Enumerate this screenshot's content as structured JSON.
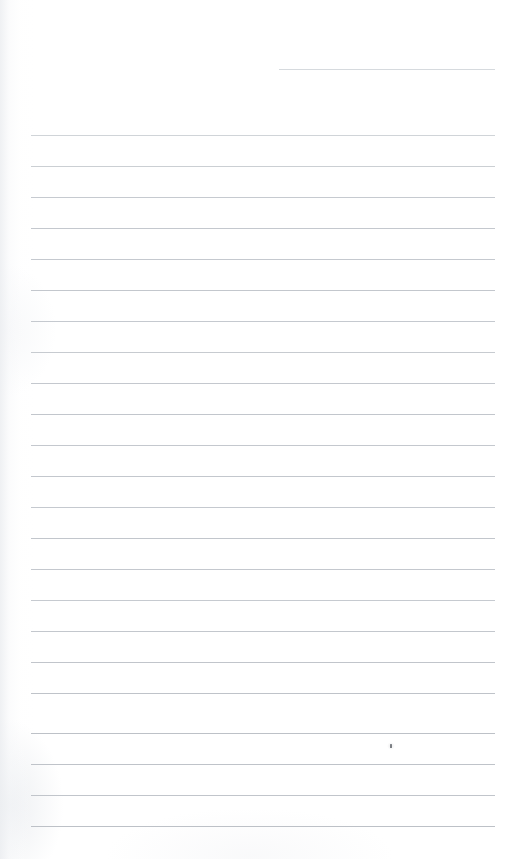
{
  "document": {
    "kind": "scanned-page",
    "title": "Blank ruled notepad page",
    "page_width": 512,
    "page_height": 859,
    "background_color": "#ffffff",
    "content_text": "",
    "has_handwriting": false,
    "notes": "Empty lined paper scan; no text, no headings, no page number."
  },
  "ruling": {
    "line_color": "#c8ccd1",
    "line_color_faint": "#d9dde1",
    "line_color_strong": "#b9bec4",
    "line_thickness_px": 1,
    "left_margin_x": 31,
    "right_margin_x": 495,
    "line_spacing_px": 31,
    "total_lines": 24,
    "partial_first_line": true,
    "lines": [
      {
        "y": 69,
        "x1": 279,
        "x2": 495,
        "color": "#cfd3d8",
        "opacity": 0.85
      },
      {
        "y": 135,
        "x1": 31,
        "x2": 495,
        "color": "#cbcfd4",
        "opacity": 0.9
      },
      {
        "y": 166,
        "x1": 31,
        "x2": 495,
        "color": "#c8ccd1",
        "opacity": 0.95
      },
      {
        "y": 197,
        "x1": 31,
        "x2": 495,
        "color": "#c6cad0",
        "opacity": 1
      },
      {
        "y": 228,
        "x1": 31,
        "x2": 495,
        "color": "#c4c8ce",
        "opacity": 1
      },
      {
        "y": 259,
        "x1": 31,
        "x2": 495,
        "color": "#c5c9cf",
        "opacity": 1
      },
      {
        "y": 290,
        "x1": 31,
        "x2": 495,
        "color": "#c3c7cd",
        "opacity": 1
      },
      {
        "y": 321,
        "x1": 31,
        "x2": 495,
        "color": "#c5c9cf",
        "opacity": 1
      },
      {
        "y": 352,
        "x1": 31,
        "x2": 495,
        "color": "#c7cbd0",
        "opacity": 1
      },
      {
        "y": 383,
        "x1": 31,
        "x2": 495,
        "color": "#c4c8ce",
        "opacity": 1
      },
      {
        "y": 414,
        "x1": 31,
        "x2": 495,
        "color": "#c2c6cc",
        "opacity": 1
      },
      {
        "y": 445,
        "x1": 31,
        "x2": 495,
        "color": "#c4c8ce",
        "opacity": 1
      },
      {
        "y": 476,
        "x1": 31,
        "x2": 495,
        "color": "#c3c7cd",
        "opacity": 1
      },
      {
        "y": 507,
        "x1": 31,
        "x2": 495,
        "color": "#c5c9cf",
        "opacity": 1
      },
      {
        "y": 538,
        "x1": 31,
        "x2": 495,
        "color": "#c2c6cc",
        "opacity": 1
      },
      {
        "y": 569,
        "x1": 31,
        "x2": 495,
        "color": "#c4c8ce",
        "opacity": 1
      },
      {
        "y": 600,
        "x1": 31,
        "x2": 495,
        "color": "#c6cad0",
        "opacity": 1
      },
      {
        "y": 631,
        "x1": 31,
        "x2": 495,
        "color": "#c3c7cd",
        "opacity": 1
      },
      {
        "y": 662,
        "x1": 31,
        "x2": 495,
        "color": "#c1c5cb",
        "opacity": 1
      },
      {
        "y": 693,
        "x1": 31,
        "x2": 495,
        "color": "#bfc3c9",
        "opacity": 1
      },
      {
        "y": 733,
        "x1": 31,
        "x2": 495,
        "color": "#bdc1c7",
        "opacity": 1
      },
      {
        "y": 764,
        "x1": 31,
        "x2": 495,
        "color": "#bfc3c9",
        "opacity": 1
      },
      {
        "y": 795,
        "x1": 31,
        "x2": 495,
        "color": "#c1c5cb",
        "opacity": 1
      },
      {
        "y": 826,
        "x1": 31,
        "x2": 495,
        "color": "#bdc1c7",
        "opacity": 1
      }
    ]
  },
  "marks": [
    {
      "name": "ink-speck",
      "x": 390,
      "y": 744,
      "width": 2,
      "height": 4,
      "color": "#5c6066"
    }
  ]
}
